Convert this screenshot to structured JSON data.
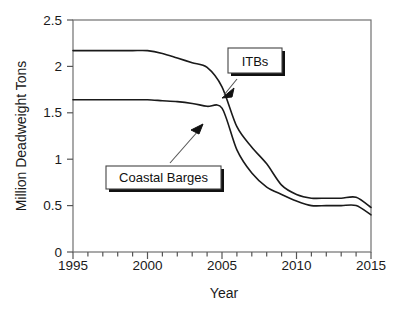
{
  "chart_data": {
    "type": "line",
    "title": "",
    "xlabel": "Year",
    "ylabel": "Million Deadweight Tons",
    "xlim": [
      1995,
      2015
    ],
    "ylim": [
      0,
      2.5
    ],
    "xticks": [
      1995,
      2000,
      2005,
      2010,
      2015
    ],
    "xtick_labels": [
      "1995",
      "2000",
      "2005",
      "2010",
      "2015"
    ],
    "x_minor_tick_step": 1,
    "yticks": [
      0,
      0.5,
      1,
      1.5,
      2,
      2.5
    ],
    "ytick_labels": [
      "0",
      "0.5",
      "1",
      "1.5",
      "2",
      "2.5"
    ],
    "grid": false,
    "legend": "none",
    "legend_position": "inline-callouts",
    "line_color": "#1a1a1a",
    "x": [
      1995,
      1996,
      1997,
      1998,
      1999,
      2000,
      2001,
      2002,
      2003,
      2004,
      2005,
      2006,
      2007,
      2008,
      2009,
      2010,
      2011,
      2012,
      2013,
      2014,
      2015
    ],
    "series": [
      {
        "name": "ITBs",
        "values": [
          2.17,
          2.17,
          2.17,
          2.17,
          2.17,
          2.17,
          2.14,
          2.09,
          2.04,
          1.99,
          1.78,
          1.35,
          1.13,
          0.95,
          0.72,
          0.62,
          0.58,
          0.58,
          0.58,
          0.59,
          0.48
        ]
      },
      {
        "name": "Coastal Barges",
        "values": [
          1.64,
          1.64,
          1.64,
          1.64,
          1.64,
          1.64,
          1.63,
          1.62,
          1.6,
          1.57,
          1.55,
          1.1,
          0.85,
          0.7,
          0.62,
          0.55,
          0.5,
          0.5,
          0.5,
          0.5,
          0.4
        ]
      }
    ],
    "annotations": [
      {
        "label": "ITBs",
        "target_x": 2005.1,
        "target_y": 1.62
      },
      {
        "label": "Coastal Barges",
        "target_x": 2003.9,
        "target_y": 1.31
      }
    ]
  }
}
